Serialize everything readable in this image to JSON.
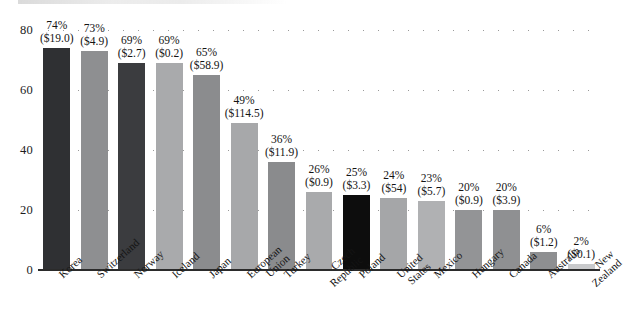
{
  "chart_data": {
    "type": "bar",
    "title": "",
    "subtitle": "",
    "xlabel": "",
    "ylabel": "",
    "ylim": [
      0,
      80
    ],
    "yticks": [
      0,
      20,
      40,
      60,
      80
    ],
    "grid": true,
    "grid_style": "dotted-horizontal",
    "legend": "none",
    "categories": [
      "Korea",
      "Switzerland",
      "Norway",
      "Iceland",
      "Japan",
      "European Union",
      "Turkey",
      "Czech Republic",
      "Poland",
      "United States",
      "Mexico",
      "Hungary",
      "Canada",
      "Australia",
      "New Zealand"
    ],
    "category_lines": [
      [
        "Korea"
      ],
      [
        "Switzerland"
      ],
      [
        "Norway"
      ],
      [
        "Iceland"
      ],
      [
        "Japan"
      ],
      [
        "European",
        "Union"
      ],
      [
        "Turkey"
      ],
      [
        "Czech",
        "Republic"
      ],
      [
        "Poland"
      ],
      [
        "United",
        "States"
      ],
      [
        "Mexico"
      ],
      [
        "Hungary"
      ],
      [
        "Canada"
      ],
      [
        "Australia"
      ],
      [
        "New",
        "Zealand"
      ]
    ],
    "values": [
      74,
      73,
      69,
      69,
      65,
      49,
      36,
      26,
      25,
      24,
      23,
      20,
      20,
      6,
      2
    ],
    "data_labels_pct": [
      "74%",
      "73%",
      "69%",
      "69%",
      "65%",
      "49%",
      "36%",
      "26%",
      "25%",
      "24%",
      "23%",
      "20%",
      "20%",
      "6%",
      "2%"
    ],
    "data_labels_amount": [
      "($19.0)",
      "($4.9)",
      "($2.7)",
      "($0.2)",
      "($58.9)",
      "($114.5)",
      "($11.9)",
      "($0.9)",
      "($3.3)",
      "($54)",
      "($5.7)",
      "($0.9)",
      "($3.9)",
      "($1.2)",
      "($0.1)"
    ],
    "bar_colors": [
      "#2f3033",
      "#8e8f91",
      "#3b3c3f",
      "#a9aaac",
      "#8b8c8e",
      "#a7a8aa",
      "#8a8b8d",
      "#a9aaac",
      "#0d0d0d",
      "#a5a6a8",
      "#b0b1b3",
      "#939496",
      "#8f9092",
      "#8e8f91",
      "#c9cacc"
    ],
    "axis_color": "#2b2b2b",
    "gridline_color": "#9a9a9a",
    "text_color": "#141414",
    "background": "#ffffff"
  }
}
